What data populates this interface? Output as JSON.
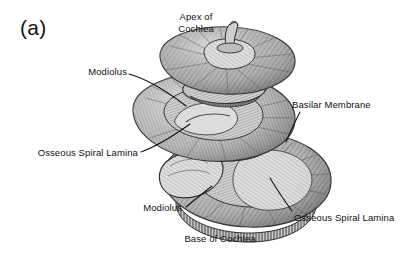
{
  "figure": {
    "panel_letter": "(a)",
    "style": "grayscale-engraving",
    "background_color": "#ffffff",
    "ink_color": "#111111",
    "labels": [
      {
        "id": "apex-of-cochlea",
        "text": "Apex of\nCochlea",
        "align": "center",
        "has_leader_line": false
      },
      {
        "id": "modiolus-upper",
        "text": "Modiolus",
        "align": "right",
        "has_leader_line": true
      },
      {
        "id": "basilar-membrane",
        "text": "Basilar Membrane",
        "align": "left",
        "has_leader_line": true
      },
      {
        "id": "osseous-spiral-lamina-upper",
        "text": "Osseous Spiral Lamina",
        "align": "right",
        "has_leader_line": true
      },
      {
        "id": "modiolus-lower",
        "text": "Modiolus",
        "align": "right",
        "has_leader_line": true
      },
      {
        "id": "osseous-spiral-lamina-lower",
        "text": "Osseous Spiral Lamina",
        "align": "left",
        "has_leader_line": true
      },
      {
        "id": "base-of-cochlea",
        "text": "Base of Cochlea",
        "align": "center",
        "has_leader_line": false
      }
    ]
  }
}
